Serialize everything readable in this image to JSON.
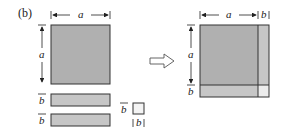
{
  "figure": {
    "panel_label": "(b)",
    "colors": {
      "fill_dark": "#b0b0b0",
      "fill_light": "#c6c6c6",
      "fill_corner": "#ececec",
      "stroke": "#333333",
      "arrow_stroke": "#555555"
    },
    "left": {
      "square": {
        "width_label": "a",
        "height_label": "a"
      },
      "strips": [
        {
          "height_label": "b"
        },
        {
          "height_label": "b"
        }
      ],
      "small_square": {
        "height_label": "b",
        "width_label": "b"
      }
    },
    "arrow": {
      "direction": "right",
      "style": "hollow"
    },
    "right": {
      "top_labels": {
        "a": "a",
        "b": "b"
      },
      "side_labels": {
        "a": "a",
        "b": "b"
      }
    }
  }
}
